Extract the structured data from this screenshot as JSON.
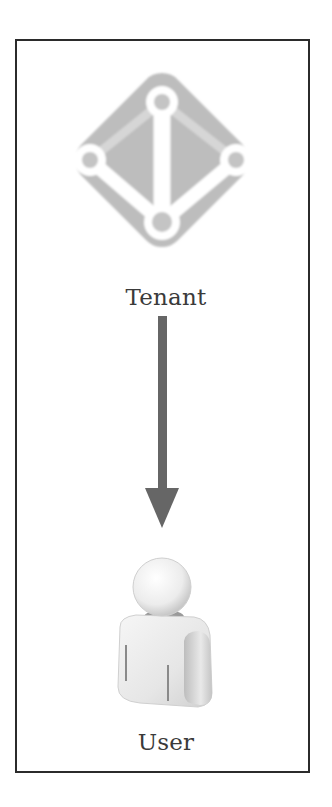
{
  "diagram": {
    "nodes": [
      {
        "id": "tenant",
        "label": "Tenant",
        "icon": "directory-tenant-icon"
      },
      {
        "id": "user",
        "label": "User",
        "icon": "user-person-icon"
      }
    ],
    "edges": [
      {
        "from": "tenant",
        "to": "user",
        "style": "solid-arrow"
      }
    ],
    "colors": {
      "border": "#2b2b2b",
      "diamond": "#b9b9b9",
      "arrow": "#666666",
      "text": "#3a3a3a"
    }
  }
}
